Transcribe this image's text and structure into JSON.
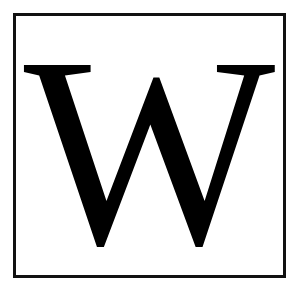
{
  "logo": {
    "letter": "W",
    "colors": {
      "foreground": "#000000",
      "background": "#ffffff",
      "border": "#111111"
    }
  }
}
